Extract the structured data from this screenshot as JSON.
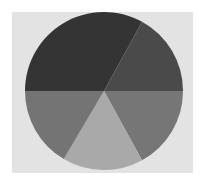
{
  "chart_data": {
    "type": "pie",
    "title": "",
    "xlabel": "",
    "ylabel": "",
    "legend": "none",
    "start_angle_deg": 270,
    "direction": "clockwise",
    "categories": [
      "Slice A",
      "Slice B",
      "Slice C",
      "Slice D",
      "Slice E"
    ],
    "values": [
      33,
      17,
      17,
      16.5,
      16.5
    ],
    "colors": [
      "#343434",
      "#4a4a4a",
      "#767676",
      "#a9a9a9",
      "#747474"
    ],
    "labels_visible": false
  },
  "layout": {
    "center_x": 104,
    "center_y": 91,
    "radius": 79,
    "panel_color": "#e3e3e3",
    "frame_color": "#ffffff"
  }
}
